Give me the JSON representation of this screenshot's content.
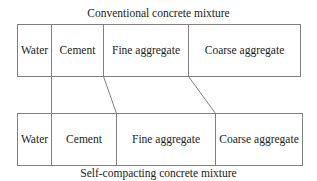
{
  "diagram": {
    "top_title": "Conventional concrete mixture",
    "bottom_title": "Self-compacting concrete mixture",
    "line_color": "#808080",
    "text_color": "#222222",
    "conventional": {
      "cells": [
        {
          "label": "Water"
        },
        {
          "label": "Cement"
        },
        {
          "label": "Fine aggregate"
        },
        {
          "label": "Coarse aggregate"
        }
      ]
    },
    "self_compacting": {
      "cells": [
        {
          "label": "Water"
        },
        {
          "label": "Cement"
        },
        {
          "label": "Fine aggregate"
        },
        {
          "label": "Coarse aggregate"
        }
      ]
    },
    "connectors": [
      {
        "from": "water/cement boundary",
        "to": "water/cement boundary"
      },
      {
        "from": "cement/fine aggregate boundary",
        "to": "cement/fine aggregate boundary"
      },
      {
        "from": "fine/coarse aggregate boundary",
        "to": "fine/coarse aggregate boundary"
      }
    ]
  }
}
